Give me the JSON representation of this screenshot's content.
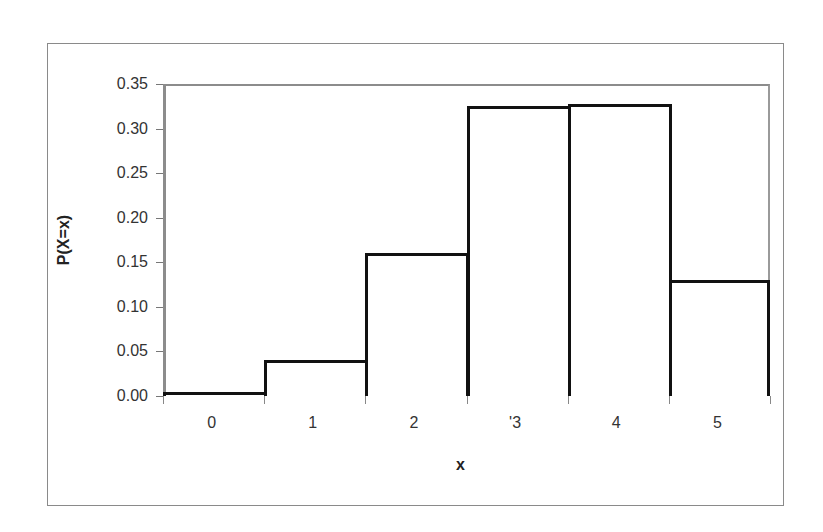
{
  "chart_data": {
    "type": "bar",
    "title": "",
    "xlabel": "x",
    "ylabel": "P(X=x)",
    "categories": [
      "0",
      "1",
      "2",
      "3",
      "4",
      "5"
    ],
    "x_tick_labels_as_rendered": [
      "0",
      "1",
      "2",
      "'3",
      "4",
      "5"
    ],
    "values": [
      0.004,
      0.04,
      0.16,
      0.325,
      0.328,
      0.13
    ],
    "ylim": [
      0,
      0.35
    ],
    "y_ticks": [
      "0.00",
      "0.05",
      "0.10",
      "0.15",
      "0.20",
      "0.25",
      "0.30",
      "0.35"
    ],
    "grid": false,
    "legend": null,
    "bar_style": {
      "fill": "#ffffff",
      "edge": "#111111",
      "gap": 0
    }
  },
  "axes": {
    "x_title": "x",
    "y_title": "P(X=x)"
  }
}
